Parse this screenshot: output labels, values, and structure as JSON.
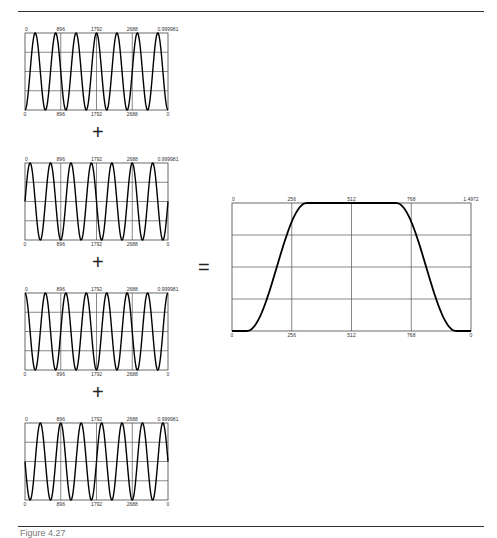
{
  "figure": {
    "caption": "Figure 4.27",
    "operators": {
      "plus": "+",
      "equals": "="
    }
  },
  "chart_data": [
    {
      "type": "line",
      "title": "",
      "xlabel": "",
      "ylabel": "",
      "x_ticks_top": [
        "0",
        "896",
        "1792",
        "2688",
        "0.999981"
      ],
      "x_ticks_bottom": [
        "0",
        "896",
        "1792",
        "2688",
        "0"
      ],
      "xlim": [
        0,
        3584
      ],
      "ylim": [
        0,
        0.999981
      ],
      "grid": true,
      "description": "sin^2 oscillation, 7 cycles, phase 0",
      "cycles": 7,
      "phase": 0.0
    },
    {
      "type": "line",
      "title": "",
      "xlabel": "",
      "ylabel": "",
      "x_ticks_top": [
        "0",
        "896",
        "1792",
        "2688",
        "0.999981"
      ],
      "x_ticks_bottom": [
        "0",
        "896",
        "1792",
        "2688",
        "0"
      ],
      "xlim": [
        0,
        3584
      ],
      "ylim": [
        0,
        0.999981
      ],
      "grid": true,
      "description": "sin^2 oscillation, 7 cycles, phase 0.25",
      "cycles": 7,
      "phase": 0.25
    },
    {
      "type": "line",
      "title": "",
      "xlabel": "",
      "ylabel": "",
      "x_ticks_top": [
        "0",
        "896",
        "1792",
        "2688",
        "0.999981"
      ],
      "x_ticks_bottom": [
        "0",
        "896",
        "1792",
        "2688",
        "0"
      ],
      "xlim": [
        0,
        3584
      ],
      "ylim": [
        0,
        0.999981
      ],
      "grid": true,
      "description": "sin^2 oscillation, 7 cycles, phase 0.5",
      "cycles": 7,
      "phase": 0.5
    },
    {
      "type": "line",
      "title": "",
      "xlabel": "",
      "ylabel": "",
      "x_ticks_top": [
        "0",
        "896",
        "1792",
        "2688",
        "0.999981"
      ],
      "x_ticks_bottom": [
        "0",
        "896",
        "1792",
        "2688",
        "0"
      ],
      "xlim": [
        0,
        3584
      ],
      "ylim": [
        0,
        0.999981
      ],
      "grid": true,
      "description": "sin^2 oscillation, 7 cycles, phase 0.75",
      "cycles": 7,
      "phase": 0.75
    },
    {
      "type": "line",
      "title": "",
      "xlabel": "",
      "ylabel": "",
      "x_ticks_top": [
        "0",
        "256",
        "512",
        "768",
        "1.4972"
      ],
      "x_ticks_bottom": [
        "0",
        "256",
        "512",
        "768",
        "0"
      ],
      "xlim": [
        0,
        1024
      ],
      "ylim": [
        0,
        1.4972
      ],
      "grid": true,
      "description": "Sum result: flat-top window, rises from ~64 to ~320, plateau ~320-704, falls to ~960",
      "x": [
        0,
        64,
        128,
        192,
        256,
        320,
        384,
        448,
        512,
        576,
        640,
        704,
        768,
        832,
        896,
        960,
        1024
      ],
      "y": [
        0,
        0,
        0.22,
        0.75,
        1.22,
        1.4972,
        1.4972,
        1.4972,
        1.4972,
        1.4972,
        1.4972,
        1.4972,
        1.22,
        0.75,
        0.22,
        0,
        0
      ]
    }
  ]
}
